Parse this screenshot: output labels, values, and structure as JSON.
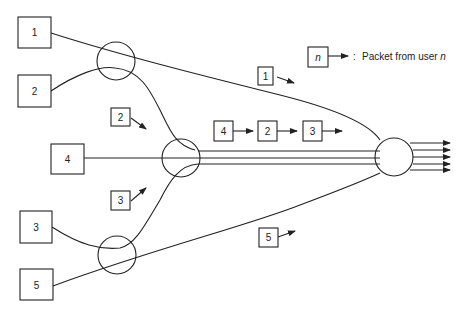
{
  "diagram": {
    "type": "packet multiplexing network",
    "users": [
      {
        "id": "user-1",
        "label": "1"
      },
      {
        "id": "user-2",
        "label": "2"
      },
      {
        "id": "user-4",
        "label": "4"
      },
      {
        "id": "user-3",
        "label": "3"
      },
      {
        "id": "user-5",
        "label": "5"
      }
    ],
    "packets": [
      {
        "id": "packet-1",
        "label": "1"
      },
      {
        "id": "packet-2-branch",
        "label": "2"
      },
      {
        "id": "packet-3-branch",
        "label": "3"
      },
      {
        "id": "packet-4-trunk",
        "label": "4"
      },
      {
        "id": "packet-2-trunk",
        "label": "2"
      },
      {
        "id": "packet-3-trunk",
        "label": "3"
      },
      {
        "id": "packet-5",
        "label": "5"
      }
    ],
    "nodes": [
      "multiplexer-top",
      "multiplexer-middle",
      "multiplexer-bottom",
      "multiplexer-output"
    ],
    "legend": {
      "symbol": "n",
      "separator": ":",
      "text": "Packet from user ",
      "text_var": "n"
    },
    "output_lines": 5
  }
}
